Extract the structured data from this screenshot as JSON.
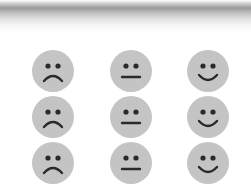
{
  "colors": {
    "face_fill": "#c4c4c4",
    "feature": "#2a2a2a",
    "background": "#ffffff"
  },
  "grid": {
    "rows": [
      {
        "faces": [
          {
            "mood": "sad",
            "icon": "sad-face-icon"
          },
          {
            "mood": "neutral",
            "icon": "neutral-face-icon"
          },
          {
            "mood": "happy",
            "icon": "happy-face-icon"
          }
        ]
      },
      {
        "faces": [
          {
            "mood": "sad",
            "icon": "sad-face-icon"
          },
          {
            "mood": "neutral",
            "icon": "neutral-face-icon"
          },
          {
            "mood": "happy",
            "icon": "happy-face-icon"
          }
        ]
      },
      {
        "faces": [
          {
            "mood": "sad",
            "icon": "sad-face-icon"
          },
          {
            "mood": "neutral",
            "icon": "neutral-face-icon"
          },
          {
            "mood": "happy",
            "icon": "happy-face-icon"
          }
        ]
      }
    ]
  }
}
